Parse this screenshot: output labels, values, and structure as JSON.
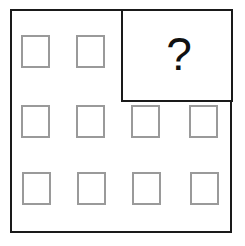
{
  "puzzle": {
    "question_mark": "?",
    "grid": {
      "rows": 3,
      "cols": 4,
      "missing_region": "top-right 2x1 cells",
      "square_color": "#9a9a9a",
      "border_color": "#1a1a1a"
    },
    "squares": [
      {
        "row": 1,
        "col": 1,
        "x": 21,
        "y": 35
      },
      {
        "row": 1,
        "col": 2,
        "x": 76,
        "y": 35
      },
      {
        "row": 2,
        "col": 1,
        "x": 21,
        "y": 105
      },
      {
        "row": 2,
        "col": 2,
        "x": 76,
        "y": 105
      },
      {
        "row": 2,
        "col": 3,
        "x": 131,
        "y": 105
      },
      {
        "row": 2,
        "col": 4,
        "x": 189,
        "y": 105
      },
      {
        "row": 3,
        "col": 1,
        "x": 22,
        "y": 172
      },
      {
        "row": 3,
        "col": 2,
        "x": 77,
        "y": 172
      },
      {
        "row": 3,
        "col": 3,
        "x": 132,
        "y": 172
      },
      {
        "row": 3,
        "col": 4,
        "x": 190,
        "y": 172
      }
    ]
  }
}
